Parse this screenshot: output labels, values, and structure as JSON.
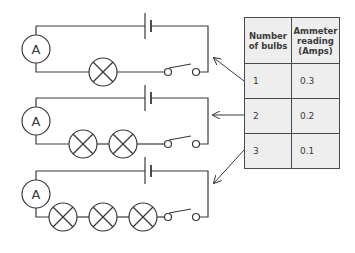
{
  "diagram": {
    "type": "circuit-diagram",
    "colors": {
      "line": "#3a3a3a",
      "table_fill": "#eeeeee",
      "table_border": "#4a4a4a"
    },
    "circuits": [
      {
        "id": 1,
        "ammeter_label": "A",
        "bulbs": 1,
        "components": [
          "cell",
          "ammeter",
          "bulb",
          "switch"
        ]
      },
      {
        "id": 2,
        "ammeter_label": "A",
        "bulbs": 2,
        "components": [
          "cell",
          "ammeter",
          "bulb",
          "bulb",
          "switch"
        ]
      },
      {
        "id": 3,
        "ammeter_label": "A",
        "bulbs": 3,
        "components": [
          "cell",
          "ammeter",
          "bulb",
          "bulb",
          "bulb",
          "switch"
        ]
      }
    ]
  },
  "table": {
    "headers": [
      "Number\nof bulbs",
      "Ammeter\nreading\n(Amps)"
    ],
    "header_1": [
      "Number",
      "of bulbs"
    ],
    "header_2": [
      "Ammeter",
      "reading",
      "(Amps)"
    ],
    "rows": [
      {
        "bulbs": "1",
        "reading": "0.3"
      },
      {
        "bulbs": "2",
        "reading": "0.2"
      },
      {
        "bulbs": "3",
        "reading": "0.1"
      }
    ]
  },
  "circuit_labels": {
    "c1": "A",
    "c2": "A",
    "c3": "A"
  }
}
